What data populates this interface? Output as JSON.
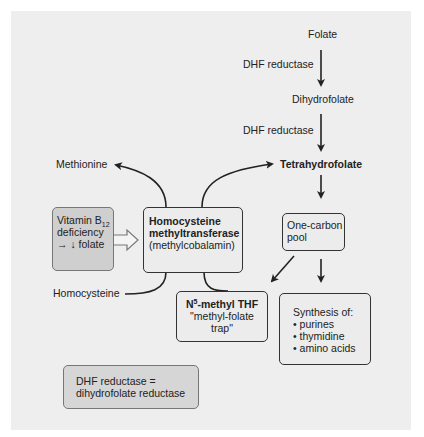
{
  "diagram": {
    "nodes": {
      "folate": "Folate",
      "dhf_reductase_1": "DHF reductase",
      "dihydrofolate": "Dihydrofolate",
      "dhf_reductase_2": "DHF reductase",
      "tetrahydrofolate": "Tetrahydrofolate",
      "methionine": "Methionine",
      "homocysteine": "Homocysteine",
      "vitamin_box": {
        "line1_prefix": "Vitamin B",
        "line1_sub": "12",
        "line2": "deficiency",
        "line3": "→ ↓ folate"
      },
      "enzyme_box": {
        "line1": "Homocysteine",
        "line2": "methyltransferase",
        "line3": "(methylcobalamin)"
      },
      "one_carbon_box": {
        "line1": "One-carbon",
        "line2": "pool"
      },
      "n5_box": {
        "prefix": "N",
        "sup": "5",
        "suffix": "-methyl THF",
        "line2": "\"methyl-folate",
        "line3": "trap\""
      },
      "synthesis_box": {
        "title": "Synthesis of:",
        "items": [
          "• purines",
          "• thymidine",
          "• amino acids"
        ]
      },
      "legend_box": {
        "line1": "DHF reductase =",
        "line2": "dihydrofolate reductase"
      }
    },
    "colors": {
      "background": "#eeeeee",
      "highlight_box": "#cfcfcf",
      "arrow": "#222222"
    }
  }
}
